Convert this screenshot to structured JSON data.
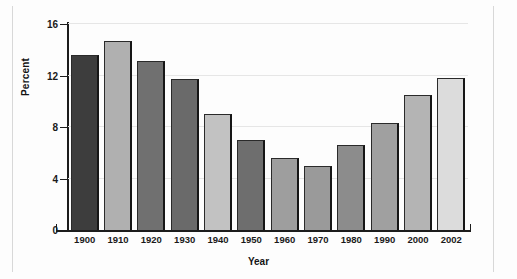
{
  "chart_data": {
    "type": "bar",
    "title": "",
    "subtitle": "",
    "xlabel": "Year",
    "ylabel": "Percent",
    "categories": [
      "1900",
      "1910",
      "1920",
      "1930",
      "1940",
      "1950",
      "1960",
      "1970",
      "1980",
      "1990",
      "2000",
      "2002"
    ],
    "values": [
      13.6,
      14.7,
      13.1,
      11.7,
      9.0,
      7.0,
      5.6,
      5.0,
      6.6,
      8.3,
      10.5,
      11.8
    ],
    "ylim": [
      0,
      16
    ],
    "yticks": [
      0,
      4,
      8,
      12,
      16
    ],
    "ytick_labels": [
      "0",
      "4",
      "8",
      "12",
      "16"
    ],
    "grid": true,
    "grid_axis": "y",
    "legend": "none",
    "bar_colors": [
      "#3d3d3d",
      "#b0b0b0",
      "#707070",
      "#6a6a6a",
      "#c2c2c2",
      "#6e6e6e",
      "#9e9e9e",
      "#9a9a9a",
      "#8c8c8c",
      "#a0a0a0",
      "#b4b4b4",
      "#dcdcdc"
    ],
    "bar_edge_color": "#2a2a2a",
    "axis_color": "#1c1c1c",
    "grid_color": "#e6e6e6",
    "background_color": "#fdfdfd"
  }
}
